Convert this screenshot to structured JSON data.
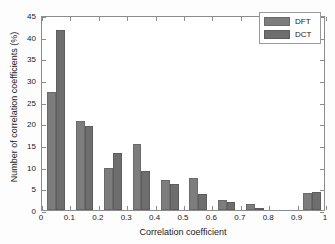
{
  "chart_data": {
    "type": "bar",
    "title": "",
    "xlabel": "Correlation coefficient",
    "ylabel": "Number of correlation coefficients (%)",
    "xlim": [
      0,
      1
    ],
    "ylim": [
      0,
      45
    ],
    "grid": false,
    "legend_position": "top-right",
    "xticks": [
      "0",
      "0.1",
      "0.2",
      "0.3",
      "0.4",
      "0.5",
      "0.6",
      "0.7",
      "0.8",
      "0.9",
      "1"
    ],
    "xtick_values": [
      0,
      0.1,
      0.2,
      0.3,
      0.4,
      0.5,
      0.6,
      0.7,
      0.8,
      0.9,
      1
    ],
    "yticks": [
      "0",
      "5",
      "10",
      "15",
      "20",
      "25",
      "30",
      "35",
      "40",
      "45"
    ],
    "ytick_values": [
      0,
      5,
      10,
      15,
      20,
      25,
      30,
      35,
      40,
      45
    ],
    "bin_centers": [
      0.05,
      0.15,
      0.25,
      0.35,
      0.45,
      0.55,
      0.65,
      0.75,
      0.85,
      0.95
    ],
    "categories": [
      "0-0.1",
      "0.1-0.2",
      "0.2-0.3",
      "0.3-0.4",
      "0.4-0.5",
      "0.5-0.6",
      "0.6-0.7",
      "0.7-0.8",
      "0.8-0.9",
      "0.9-1"
    ],
    "series": [
      {
        "name": "DFT",
        "color": "#7d7d7d",
        "values": [
          27.2,
          20.5,
          9.8,
          15.3,
          6.9,
          7.5,
          2.4,
          1.4,
          0.0,
          4.0
        ]
      },
      {
        "name": "DCT",
        "color": "#6e6e6e",
        "values": [
          41.6,
          19.3,
          13.2,
          8.9,
          5.9,
          3.7,
          1.8,
          0.3,
          0.0,
          4.2
        ]
      }
    ]
  },
  "legend": {
    "entries": [
      {
        "label": "DFT"
      },
      {
        "label": "DCT"
      }
    ]
  }
}
